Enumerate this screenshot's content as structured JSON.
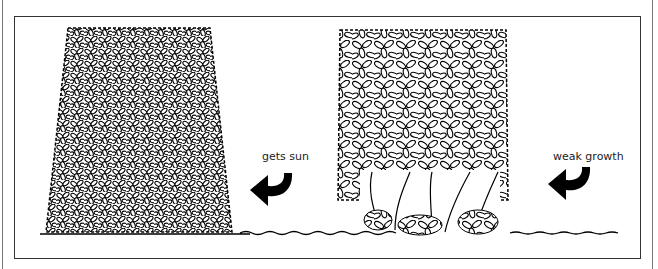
{
  "diagram": {
    "panels": [
      {
        "id": "tapered-hedge",
        "description": "hedge wider at base, dense foliage to ground",
        "annotation": "gets sun"
      },
      {
        "id": "straight-hedge",
        "description": "straight-sided hedge with bare stems at base",
        "annotation": "weak growth"
      }
    ],
    "labels": {
      "left_arrow": "gets sun",
      "right_arrow": "weak growth"
    },
    "colors": {
      "ink": "#000000",
      "background": "#ffffff",
      "frame": "#333333"
    }
  }
}
